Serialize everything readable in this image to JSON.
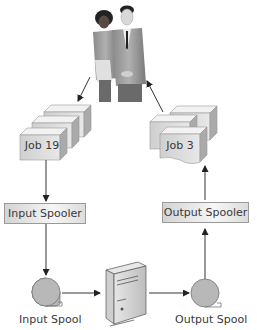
{
  "diagram": {
    "type": "spooling-flow",
    "users": {
      "name": "users",
      "description": "two business people"
    },
    "jobs": {
      "input_job": "Job 19",
      "output_job": "Job 3"
    },
    "spoolers": {
      "input": "Input Spooler",
      "output": "Output Spooler"
    },
    "spools": {
      "input": "Input Spool",
      "output": "Output Spool"
    },
    "processor": {
      "name": "computer",
      "description": "tower computer"
    },
    "flow": [
      "users -> Job 19",
      "Job 19 -> Input Spooler",
      "Input Spooler -> Input Spool",
      "Input Spool -> computer",
      "computer -> Output Spool",
      "Output Spool -> Output Spooler",
      "Output Spooler -> Job 3",
      "Job 3 -> users"
    ],
    "colors": {
      "box_fill": "#d9d9d9",
      "spool_fill": "#b8b8b8",
      "line": "#333333",
      "border": "#9a9a9a"
    }
  }
}
